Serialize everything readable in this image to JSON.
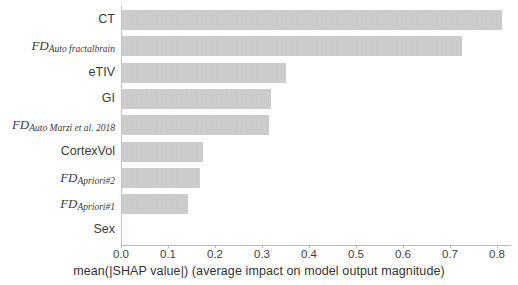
{
  "chart_data": {
    "type": "bar",
    "orientation": "horizontal",
    "title": "",
    "xlabel": "mean(|SHAP value|) (average impact on model output magnitude)",
    "ylabel": "",
    "xlim": [
      0.0,
      0.85
    ],
    "grid": false,
    "legend": null,
    "bar_color": "#c9c9c9",
    "categories": [
      "CT",
      "FD_Auto fractalbrain",
      "eTIV",
      "GI",
      "FD_Auto Marzi et al. 2018",
      "CortexVol",
      "FD_Apriori#2",
      "FD_Apriori#1",
      "Sex"
    ],
    "values": [
      0.81,
      0.725,
      0.35,
      0.32,
      0.315,
      0.175,
      0.168,
      0.142,
      0.0
    ],
    "xticks": [
      0.0,
      0.1,
      0.2,
      0.3,
      0.4,
      0.5,
      0.6,
      0.7,
      0.8
    ],
    "xticklabels": [
      "0.0",
      "0.1",
      "0.2",
      "0.3",
      "0.4",
      "0.5",
      "0.6",
      "0.7",
      "0.8"
    ]
  },
  "ylabels": [
    {
      "main": "CT",
      "sub": "",
      "italic": false
    },
    {
      "main": "FD",
      "sub": "Auto fractalbrain",
      "italic": true
    },
    {
      "main": "eTIV",
      "sub": "",
      "italic": false
    },
    {
      "main": "GI",
      "sub": "",
      "italic": false
    },
    {
      "main": "FD",
      "sub": "Auto Marzi et al. 2018",
      "italic": true
    },
    {
      "main": "CortexVol",
      "sub": "",
      "italic": false
    },
    {
      "main": "FD",
      "sub": "Apriori#2",
      "italic": true
    },
    {
      "main": "FD",
      "sub": "Apriori#1",
      "italic": true
    },
    {
      "main": "Sex",
      "sub": "",
      "italic": false
    }
  ],
  "axis": {
    "x_title": "mean(|SHAP value|) (average impact on model output magnitude)"
  }
}
